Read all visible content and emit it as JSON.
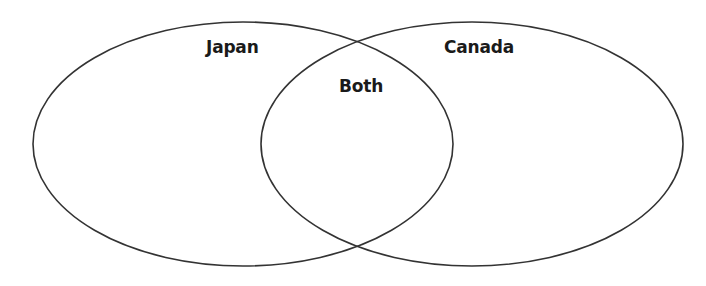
{
  "diagram": {
    "type": "venn",
    "sets": [
      {
        "id": "left",
        "label": "Japan"
      },
      {
        "id": "right",
        "label": "Canada"
      }
    ],
    "intersection": {
      "label": "Both"
    },
    "colors": {
      "stroke": "#333333",
      "text": "#1a1a1a",
      "background": "#ffffff"
    }
  }
}
